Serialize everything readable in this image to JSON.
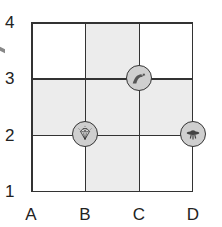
{
  "grid": {
    "columns": [
      "A",
      "B",
      "C",
      "D"
    ],
    "rows": [
      "1",
      "2",
      "3",
      "4"
    ],
    "shaded_cells": [
      {
        "col": 1,
        "row": 0,
        "note": "between B-C columns, row 3-4 band"
      },
      {
        "col": 0,
        "row": 1
      },
      {
        "col": 1,
        "row": 1
      },
      {
        "col": 2,
        "row": 1
      },
      {
        "col": 1,
        "row": 2
      }
    ],
    "colors": {
      "shaded": "#ececec",
      "line": "#333333",
      "token": "#cfcfcf"
    }
  },
  "labels": {
    "x": [
      "A",
      "B",
      "C",
      "D"
    ],
    "y": [
      "4",
      "3",
      "2",
      "1"
    ]
  },
  "tokens": [
    {
      "name": "dinosaur",
      "icon": "dinosaur-icon",
      "position": "C3"
    },
    {
      "name": "diamond",
      "icon": "diamond-icon",
      "position": "B2"
    },
    {
      "name": "ufo",
      "icon": "ufo-icon",
      "position": "D2"
    }
  ]
}
